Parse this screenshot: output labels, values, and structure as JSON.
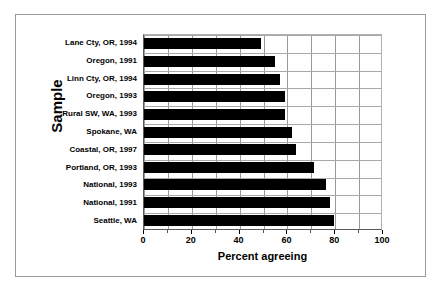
{
  "chart_data": {
    "type": "bar",
    "orientation": "horizontal",
    "title": "",
    "xlabel": "Percent agreeing",
    "ylabel": "Sample",
    "xlim": [
      0,
      100
    ],
    "xticks": [
      0,
      20,
      40,
      60,
      80,
      100
    ],
    "xtick_labels": [
      "0",
      "20",
      "40",
      "60",
      "80",
      "100"
    ],
    "minor_gridline_interval": 10,
    "grid": true,
    "legend": false,
    "bar_color": "#000000",
    "gridline_color": "#9a9a9a",
    "categories": [
      "Lane Cty, OR, 1994",
      "Oregon, 1991",
      "Linn Cty, OR, 1994",
      "Oregon, 1993",
      "Rural SW, WA, 1993",
      "Spokane, WA",
      "Coastal, OR, 1997",
      "Portland, OR, 1993",
      "National, 1993",
      "National, 1991",
      "Seattle, WA"
    ],
    "values": [
      49,
      55,
      57,
      59,
      59,
      62,
      63.5,
      71,
      76,
      78,
      79.5
    ]
  }
}
